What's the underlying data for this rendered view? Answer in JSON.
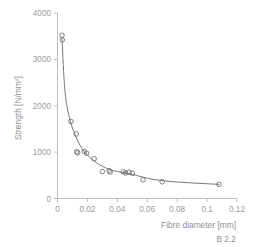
{
  "caption": "B 2.2",
  "chart_data": {
    "type": "scatter",
    "title": "",
    "xlabel": "Fibre diameter [mm]",
    "ylabel": "Strength [N/mm²]",
    "xlim": [
      0,
      0.12
    ],
    "ylim": [
      0,
      4000
    ],
    "grid": false,
    "legend": false,
    "xticks": [
      0,
      0.02,
      0.04,
      0.06,
      0.08,
      0.1,
      0.12
    ],
    "xticklabels": [
      "0",
      "0.02",
      "0.04",
      "0.06",
      "0.08",
      "0.1",
      "0.12"
    ],
    "yticks": [
      0,
      1000,
      2000,
      3000,
      4000
    ],
    "yticklabels": [
      "0",
      "1000",
      "2000",
      "3000",
      "4000"
    ],
    "marker": "open-circle",
    "points": [
      {
        "x": 0.003,
        "y": 3520
      },
      {
        "x": 0.0032,
        "y": 3420
      },
      {
        "x": 0.009,
        "y": 1660
      },
      {
        "x": 0.0125,
        "y": 1390
      },
      {
        "x": 0.0128,
        "y": 1010
      },
      {
        "x": 0.0135,
        "y": 985
      },
      {
        "x": 0.018,
        "y": 1015
      },
      {
        "x": 0.0195,
        "y": 975
      },
      {
        "x": 0.0245,
        "y": 860
      },
      {
        "x": 0.03,
        "y": 580
      },
      {
        "x": 0.0345,
        "y": 600
      },
      {
        "x": 0.0352,
        "y": 570
      },
      {
        "x": 0.044,
        "y": 575
      },
      {
        "x": 0.0455,
        "y": 550
      },
      {
        "x": 0.0478,
        "y": 565
      },
      {
        "x": 0.05,
        "y": 545
      },
      {
        "x": 0.0572,
        "y": 405
      },
      {
        "x": 0.07,
        "y": 360
      },
      {
        "x": 0.108,
        "y": 305
      }
    ],
    "fit_curve": [
      {
        "x": 0.003,
        "y": 3470
      },
      {
        "x": 0.0045,
        "y": 2520
      },
      {
        "x": 0.006,
        "y": 2050
      },
      {
        "x": 0.008,
        "y": 1740
      },
      {
        "x": 0.01,
        "y": 1520
      },
      {
        "x": 0.0125,
        "y": 1320
      },
      {
        "x": 0.015,
        "y": 1150
      },
      {
        "x": 0.018,
        "y": 1010
      },
      {
        "x": 0.021,
        "y": 900
      },
      {
        "x": 0.0245,
        "y": 810
      },
      {
        "x": 0.028,
        "y": 730
      },
      {
        "x": 0.032,
        "y": 665
      },
      {
        "x": 0.036,
        "y": 615
      },
      {
        "x": 0.04,
        "y": 582
      },
      {
        "x": 0.045,
        "y": 552
      },
      {
        "x": 0.05,
        "y": 520
      },
      {
        "x": 0.056,
        "y": 470
      },
      {
        "x": 0.062,
        "y": 425
      },
      {
        "x": 0.07,
        "y": 385
      },
      {
        "x": 0.08,
        "y": 355
      },
      {
        "x": 0.09,
        "y": 335
      },
      {
        "x": 0.1,
        "y": 318
      },
      {
        "x": 0.108,
        "y": 305
      }
    ]
  }
}
